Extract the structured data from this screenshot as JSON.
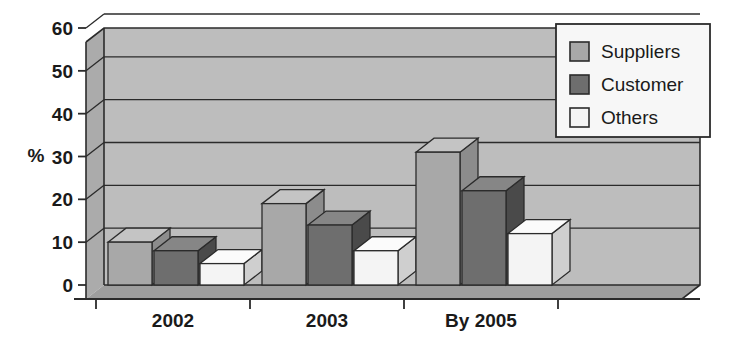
{
  "chart_data": {
    "type": "bar",
    "title": "",
    "subtitle": "",
    "xlabel": "",
    "ylabel": "%",
    "categories": [
      "2002",
      "2003",
      "By 2005"
    ],
    "series": [
      {
        "name": "Suppliers",
        "values": [
          10,
          19,
          31
        ],
        "color": "#a8a8a8"
      },
      {
        "name": "Customer",
        "values": [
          8,
          14,
          22
        ],
        "color": "#6e6e6e"
      },
      {
        "name": "Others",
        "values": [
          5,
          8,
          12
        ],
        "color": "#f2f2f2"
      }
    ],
    "ylim": [
      0,
      60
    ],
    "yticks": [
      0,
      10,
      20,
      30,
      40,
      50,
      60
    ],
    "ytick_labels": [
      "0",
      "10",
      "20",
      "30",
      "40",
      "50",
      "60"
    ],
    "grid": true,
    "grid_axis": "y",
    "legend_position": "top-right",
    "style": "3d-column",
    "plot_background": "#bdbdbd"
  },
  "legend": {
    "items": [
      {
        "label": "Suppliers",
        "swatch": "legend-swatch-suppliers"
      },
      {
        "label": "Customer",
        "swatch": "legend-swatch-customer"
      },
      {
        "label": "Others",
        "swatch": "legend-swatch-others"
      }
    ]
  },
  "axes": {
    "y_title": "%",
    "y_ticks": [
      "60",
      "50",
      "40",
      "30",
      "20",
      "10",
      "0"
    ],
    "x_ticks": [
      "2002",
      "2003",
      "By 2005"
    ]
  },
  "colors": {
    "plot_bg": "#bdbdbd",
    "plot_bg_side": "#ababab",
    "plot_bg_floor": "#9e9e9e",
    "series_suppliers": "#a8a8a8",
    "series_suppliers_top": "#c4c4c4",
    "series_suppliers_side": "#8c8c8c",
    "series_customer": "#6e6e6e",
    "series_customer_top": "#868686",
    "series_customer_side": "#4a4a4a",
    "series_others": "#f4f4f4",
    "series_others_top": "#fbfbfb",
    "series_others_side": "#cfcfcf",
    "outline": "#2b2b2b",
    "text": "#1a1a1a",
    "legend_bg": "#f7f7f7"
  }
}
